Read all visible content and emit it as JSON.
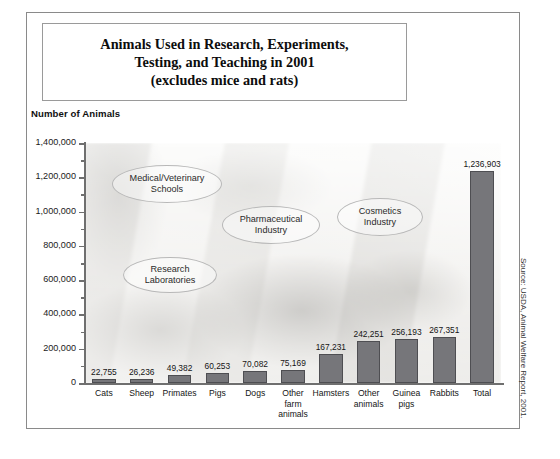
{
  "title": {
    "line1": "Animals Used in Research, Experiments,",
    "line2": "Testing, and Teaching in 2001",
    "line3": "(excludes mice and rats)"
  },
  "source_note": "Source: USDA, Animal Welfare Report, 2001.",
  "chart_data": {
    "type": "bar",
    "title": "Animals Used in Research, Experiments, Testing, and Teaching in 2001 (excludes mice and rats)",
    "xlabel": "",
    "ylabel": "Number of Animals",
    "ylim": [
      0,
      1400000
    ],
    "ytick_labels": [
      "1,400,000",
      "1,200,000",
      "1,000,000",
      "800,000",
      "600,000",
      "400,000",
      "200,000",
      "0"
    ],
    "ytick_values": [
      1400000,
      1200000,
      1000000,
      800000,
      600000,
      400000,
      200000,
      0
    ],
    "grid": false,
    "legend": "none",
    "categories": [
      "Cats",
      "Sheep",
      "Primates",
      "Pigs",
      "Dogs",
      "Other farm animals",
      "Hamsters",
      "Other animals",
      "Guinea pigs",
      "Rabbits",
      "Total"
    ],
    "values": [
      22755,
      26236,
      49382,
      60253,
      70082,
      75169,
      167231,
      242251,
      256193,
      267351,
      1236903
    ],
    "value_labels": [
      "22,755",
      "26,236",
      "49,382",
      "60,253",
      "70,082",
      "75,169",
      "167,231",
      "242,251",
      "256,193",
      "267,351",
      "1,236,903"
    ],
    "bar_color": "#76767a",
    "annotations": [
      "Medical/Veterinary Schools",
      "Pharmaceutical Industry",
      "Cosmetics Industry",
      "Research Laboratories"
    ]
  },
  "x_label_lines": [
    [
      "Cats"
    ],
    [
      "Sheep"
    ],
    [
      "Primates"
    ],
    [
      "Pigs"
    ],
    [
      "Dogs"
    ],
    [
      "Other",
      "farm",
      "animals"
    ],
    [
      "Hamsters"
    ],
    [
      "Other",
      "animals"
    ],
    [
      "Guinea",
      "pigs"
    ],
    [
      "Rabbits"
    ],
    [
      "Total"
    ]
  ],
  "callouts": [
    {
      "line1": "Medical/Veterinary",
      "line2": "Schools"
    },
    {
      "line1": "Pharmaceutical",
      "line2": "Industry"
    },
    {
      "line1": "Cosmetics",
      "line2": "Industry"
    },
    {
      "line1": "Research",
      "line2": "Laboratories"
    }
  ]
}
